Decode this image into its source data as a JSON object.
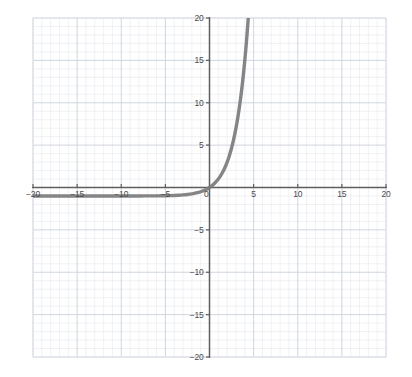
{
  "chart_data": {
    "type": "line",
    "title": "",
    "subtitle": "",
    "xlabel": "",
    "ylabel": "",
    "xlim": [
      -20,
      20
    ],
    "ylim": [
      -20,
      20
    ],
    "grid": true,
    "grid_minor_step": 1,
    "grid_major_step": 5,
    "legend": "none",
    "background": "graph-paper",
    "axis_color": "#5e5e5e",
    "grid_minor_color": "#e3e6ec",
    "grid_major_color": "#ccd2dc",
    "curve_color": "#7b7b7b",
    "curve_width": 3.4,
    "function": "y = 2^x - 1",
    "asymptote": -1,
    "x_ticks": [
      -20,
      -15,
      -10,
      -5,
      0,
      5,
      10,
      15,
      20
    ],
    "x_tick_labels": [
      "-20",
      "-15",
      "-10",
      "-5",
      "0",
      "5",
      "10",
      "15",
      "20"
    ],
    "y_ticks": [
      -20,
      -15,
      -10,
      -5,
      5,
      10,
      15,
      20
    ],
    "y_tick_labels": [
      "-20",
      "-15",
      "-10",
      "-5",
      "5",
      "10",
      "15",
      "20"
    ],
    "origin_label": "0",
    "series": [
      {
        "name": "y = 2^x - 1",
        "points": [
          [
            -20.0,
            -1.0
          ],
          [
            -18.0,
            -1.0
          ],
          [
            -16.0,
            -1.0
          ],
          [
            -14.0,
            -1.0
          ],
          [
            -12.0,
            -1.0
          ],
          [
            -10.0,
            -0.999
          ],
          [
            -8.0,
            -0.996
          ],
          [
            -6.0,
            -0.984
          ],
          [
            -5.0,
            -0.969
          ],
          [
            -4.0,
            -0.938
          ],
          [
            -3.5,
            -0.912
          ],
          [
            -3.0,
            -0.875
          ],
          [
            -2.5,
            -0.823
          ],
          [
            -2.0,
            -0.75
          ],
          [
            -1.5,
            -0.646
          ],
          [
            -1.0,
            -0.5
          ],
          [
            -0.5,
            -0.293
          ],
          [
            0.0,
            0.0
          ],
          [
            0.25,
            0.189
          ],
          [
            0.5,
            0.414
          ],
          [
            0.75,
            0.682
          ],
          [
            1.0,
            1.0
          ],
          [
            1.25,
            1.378
          ],
          [
            1.5,
            1.828
          ],
          [
            1.75,
            2.363
          ],
          [
            2.0,
            3.0
          ],
          [
            2.25,
            3.757
          ],
          [
            2.5,
            4.657
          ],
          [
            2.75,
            5.727
          ],
          [
            3.0,
            7.0
          ],
          [
            3.25,
            8.514
          ],
          [
            3.5,
            10.314
          ],
          [
            3.75,
            12.454
          ],
          [
            4.0,
            15.0
          ],
          [
            4.2,
            17.37
          ],
          [
            4.392,
            20.0
          ]
        ]
      }
    ]
  }
}
